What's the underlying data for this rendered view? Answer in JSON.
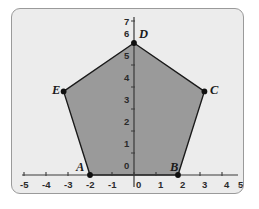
{
  "figure": {
    "kind": "coordinate-plane-pentagon",
    "background_color": "#ececec",
    "border_color": "#9a9a9a",
    "polygon_fill": "#9a9a9a",
    "polygon_stroke": "#1a1a1a",
    "axis_color": "#3a3a3a"
  },
  "chart_data": {
    "type": "scatter",
    "title": "",
    "xlabel": "",
    "ylabel": "",
    "xlim": [
      -5,
      5
    ],
    "ylim": [
      0,
      7
    ],
    "grid": false,
    "legend": "none",
    "x_ticks": [
      -5,
      -4,
      -3,
      -2,
      -1,
      0,
      1,
      2,
      3,
      4,
      5
    ],
    "x_tick_labels": [
      "-5",
      "-4",
      "-3",
      "-2",
      "-1",
      "0",
      "1",
      "2",
      "3",
      "4",
      "5"
    ],
    "y_ticks": [
      0,
      1,
      2,
      3,
      4,
      5,
      6,
      7
    ],
    "y_tick_labels": [
      "0",
      "1",
      "2",
      "3",
      "4",
      "5",
      "6",
      "7"
    ],
    "shapes": [
      {
        "name": "pentagon-ABCDE",
        "closed": true,
        "fill": "#9a9a9a",
        "stroke": "#1a1a1a",
        "points": [
          {
            "label": "A",
            "x": -2,
            "y": 0
          },
          {
            "label": "B",
            "x": 2,
            "y": 0
          },
          {
            "label": "C",
            "x": 3.2,
            "y": 3.8
          },
          {
            "label": "D",
            "x": 0,
            "y": 6
          },
          {
            "label": "E",
            "x": -3.2,
            "y": 3.8
          }
        ]
      }
    ],
    "points": [
      {
        "label": "A",
        "x": -2,
        "y": 0,
        "label_pos": "left"
      },
      {
        "label": "B",
        "x": 2,
        "y": 0,
        "label_pos": "left"
      },
      {
        "label": "C",
        "x": 3.2,
        "y": 3.8,
        "label_pos": "right"
      },
      {
        "label": "D",
        "x": 0,
        "y": 6,
        "label_pos": "right"
      },
      {
        "label": "E",
        "x": -3.2,
        "y": 3.8,
        "label_pos": "left"
      }
    ]
  },
  "labels": {
    "A": "A",
    "B": "B",
    "C": "C",
    "D": "D",
    "E": "E"
  },
  "x_axis": {
    "t_neg5": "-5",
    "t_neg4": "-4",
    "t_neg3": "-3",
    "t_neg2": "-2",
    "t_neg1": "-1",
    "t_0": "0",
    "t_1": "1",
    "t_2": "2",
    "t_3": "3",
    "t_4": "4",
    "t_5": "5"
  },
  "y_axis": {
    "t_0": "0",
    "t_1": "1",
    "t_2": "2",
    "t_3": "3",
    "t_4": "4",
    "t_5": "5",
    "t_6": "6",
    "t_7": "7"
  }
}
